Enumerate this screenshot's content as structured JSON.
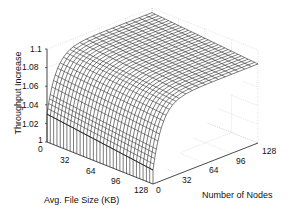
{
  "chart_data": {
    "type": "surface",
    "title": "",
    "xlabel": "Avg. File Size (KB)",
    "ylabel": "Number of Nodes",
    "zlabel": "Throughput Increase",
    "x_ticks": [
      "0",
      "32",
      "64",
      "96",
      "128"
    ],
    "y_ticks": [
      "0",
      "32",
      "64",
      "96",
      "128"
    ],
    "z_ticks": [
      "1",
      "1.02",
      "1.04",
      "1.06",
      "1.08",
      "1.1"
    ],
    "xlim": [
      0,
      128
    ],
    "ylim": [
      0,
      128
    ],
    "zlim": [
      1,
      1.1
    ],
    "grid": true,
    "surface_description": "Throughput increase rises steeply with number of nodes then plateaus; decreases slightly with larger average file size",
    "sample_points": [
      {
        "file_size_kb": 0,
        "nodes": 1,
        "throughput_increase": 1.03
      },
      {
        "file_size_kb": 0,
        "nodes": 8,
        "throughput_increase": 1.06
      },
      {
        "file_size_kb": 0,
        "nodes": 32,
        "throughput_increase": 1.09
      },
      {
        "file_size_kb": 0,
        "nodes": 128,
        "throughput_increase": 1.095
      },
      {
        "file_size_kb": 128,
        "nodes": 1,
        "throughput_increase": 1.015
      },
      {
        "file_size_kb": 128,
        "nodes": 32,
        "throughput_increase": 1.08
      },
      {
        "file_size_kb": 128,
        "nodes": 128,
        "throughput_increase": 1.085
      }
    ]
  },
  "labels": {
    "z": [
      "1",
      "1.02",
      "1.04",
      "1.06",
      "1.08",
      "1.1"
    ],
    "x": [
      "0",
      "32",
      "64",
      "96",
      "128"
    ],
    "y": [
      "0",
      "32",
      "64",
      "96",
      "128"
    ],
    "z_title": "Throughput Increase",
    "x_title": "Avg. File Size (KB)",
    "y_title": "Number of Nodes"
  }
}
